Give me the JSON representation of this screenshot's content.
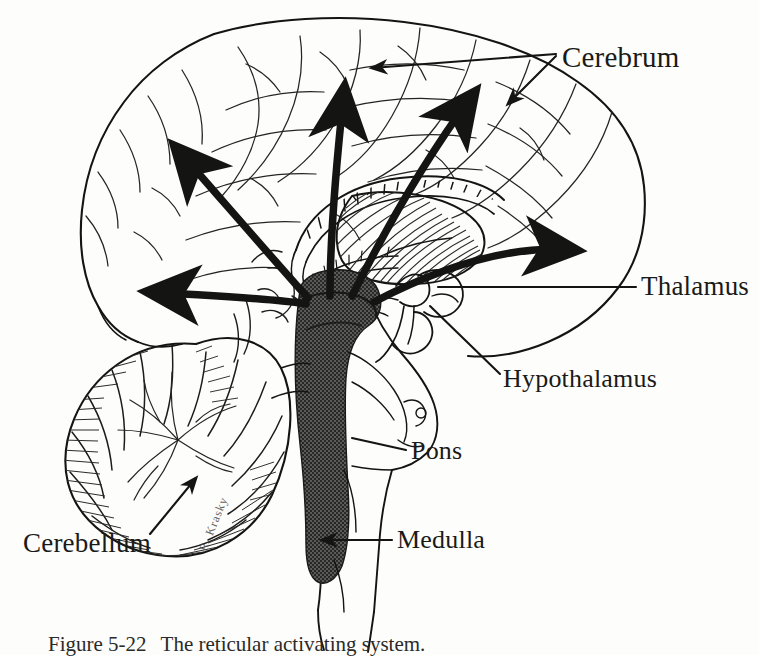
{
  "figure": {
    "type": "anatomical-illustration",
    "medium": "pen-and-ink line drawing",
    "signature": "R. Krasky"
  },
  "labels": {
    "cerebrum": "Cerebrum",
    "thalamus": "Thalamus",
    "hypothalamus": "Hypothalamus",
    "pons": "Pons",
    "medulla": "Medulla",
    "cerebellum": "Cerebellum"
  },
  "caption": {
    "number": "Figure 5-22",
    "text": "The reticular activating system."
  },
  "colors": {
    "ink": "#141412",
    "paper": "#fdfdfc",
    "brainstem_shade": "#4f4f4d",
    "hatch": "#2b2b29"
  },
  "structures": [
    {
      "name": "cerebrum",
      "note": "large outer cortical mass with gyri and sulci, occupies upper two-thirds"
    },
    {
      "name": "corpus-callosum",
      "note": "arching band above the thalamus"
    },
    {
      "name": "thalamus",
      "note": "ovoid hatched mass at center of brain"
    },
    {
      "name": "hypothalamus",
      "note": "small region below thalamus, anterior to brainstem"
    },
    {
      "name": "reticular-formation",
      "note": "dark gray shaded column through midbrain, pons and medulla"
    },
    {
      "name": "pons",
      "note": "bulging anterior region of brainstem"
    },
    {
      "name": "medulla",
      "note": "lower brainstem continuing into spinal cord"
    },
    {
      "name": "cerebellum",
      "note": "foliated lobed structure at lower left with fine hatching"
    },
    {
      "name": "spinal-cord",
      "note": "tapering continuation below the medulla"
    }
  ],
  "arrows": {
    "thick_projection_count": 5,
    "description": "Heavy black arrows radiate from the reticular formation up and outward into the cerebral cortex and laterally toward the thalamus",
    "leaders": [
      {
        "target": "cerebrum",
        "style": "thin-line-arrow"
      },
      {
        "target": "thalamus",
        "style": "thin-line"
      },
      {
        "target": "hypothalamus",
        "style": "thin-line"
      },
      {
        "target": "pons",
        "style": "thin-line"
      },
      {
        "target": "medulla",
        "style": "thin-line-arrow"
      },
      {
        "target": "cerebellum",
        "style": "thin-line-arrow"
      }
    ]
  }
}
